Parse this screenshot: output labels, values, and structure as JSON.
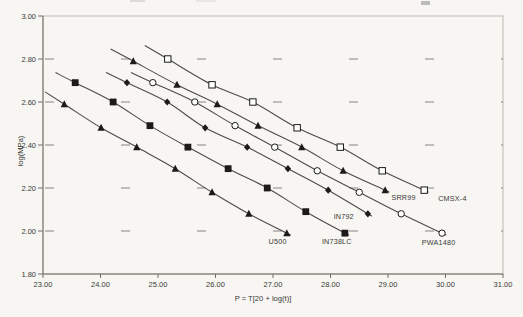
{
  "figure": {
    "background": "#f7f6f3",
    "frame_color": "#bcbab3",
    "axis_color": "#6e6c66",
    "grid_dash_color": "#858580",
    "curve_color": "#4d4b47",
    "marker_color": "#1c1b19",
    "text_color": "#3a3935",
    "artifact_color": "#8a8a86"
  },
  "chart_data": {
    "type": "scatter",
    "title": "",
    "xlabel": "P = T[20 + log(t)]",
    "ylabel": "log(MPa)",
    "xlim": [
      23,
      31
    ],
    "ylim": [
      1.8,
      3.0
    ],
    "x_ticks": [
      23,
      24,
      25,
      26,
      27,
      28,
      29,
      30,
      31
    ],
    "x_tick_labels": [
      "23.00",
      "24.00",
      "25.00",
      "26.00",
      "27.00",
      "28.00",
      "29.00",
      "30.00",
      "31.00"
    ],
    "y_ticks": [
      3.0,
      2.8,
      2.6,
      2.4,
      2.2,
      2.0,
      1.8
    ],
    "y_tick_labels": [
      "3.00",
      "2.80",
      "2.60",
      "2.40",
      "2.20",
      "2.00",
      "1.80"
    ],
    "grid": "horizontal gridlines drawn as sparse short dashes",
    "legend_position": "labels placed next to end of each curve",
    "series": [
      {
        "name": "U500",
        "marker": "filled-triangle",
        "label_pos": {
          "p": 27.08,
          "log": 1.95
        },
        "points": [
          [
            23.37,
            2.59
          ],
          [
            24.01,
            2.48
          ],
          [
            24.63,
            2.39
          ],
          [
            25.3,
            2.29
          ],
          [
            25.94,
            2.18
          ],
          [
            26.58,
            2.08
          ],
          [
            27.24,
            1.99
          ]
        ]
      },
      {
        "name": "IN738LC",
        "marker": "filled-square",
        "label_pos": {
          "p": 28.11,
          "log": 1.95
        },
        "points": [
          [
            23.56,
            2.69
          ],
          [
            24.22,
            2.6
          ],
          [
            24.86,
            2.49
          ],
          [
            25.52,
            2.39
          ],
          [
            26.22,
            2.29
          ],
          [
            26.9,
            2.2
          ],
          [
            27.57,
            2.09
          ],
          [
            28.25,
            1.99
          ]
        ]
      },
      {
        "name": "IN792",
        "marker": "filled-diamond",
        "label_pos": {
          "p": 28.23,
          "log": 2.068
        },
        "points": [
          [
            24.46,
            2.69
          ],
          [
            25.16,
            2.6
          ],
          [
            25.82,
            2.48
          ],
          [
            26.55,
            2.39
          ],
          [
            27.26,
            2.29
          ],
          [
            27.96,
            2.19
          ],
          [
            28.65,
            2.08
          ]
        ]
      },
      {
        "name": "SRR99",
        "marker": "filled-triangle",
        "label_pos": {
          "p": 29.27,
          "log": 2.158
        },
        "points": [
          [
            24.57,
            2.79
          ],
          [
            25.33,
            2.68
          ],
          [
            26.03,
            2.59
          ],
          [
            26.74,
            2.49
          ],
          [
            27.5,
            2.39
          ],
          [
            28.22,
            2.28
          ],
          [
            28.95,
            2.19
          ]
        ]
      },
      {
        "name": "PWA1480",
        "marker": "open-circle",
        "label_pos": {
          "p": 29.88,
          "log": 1.948
        },
        "points": [
          [
            24.91,
            2.69
          ],
          [
            25.64,
            2.6
          ],
          [
            26.34,
            2.49
          ],
          [
            27.03,
            2.39
          ],
          [
            27.77,
            2.28
          ],
          [
            28.5,
            2.18
          ],
          [
            29.23,
            2.08
          ],
          [
            29.94,
            1.99
          ]
        ]
      },
      {
        "name": "CMSX-4",
        "marker": "open-square",
        "label_pos": {
          "p": 30.12,
          "log": 2.152
        },
        "points": [
          [
            25.17,
            2.8
          ],
          [
            25.94,
            2.68
          ],
          [
            26.65,
            2.6
          ],
          [
            27.42,
            2.48
          ],
          [
            28.17,
            2.39
          ],
          [
            28.9,
            2.28
          ],
          [
            29.63,
            2.19
          ]
        ]
      }
    ]
  },
  "artifacts": {
    "note": "faint remnants of a cropped-off title line at the very top edge"
  }
}
